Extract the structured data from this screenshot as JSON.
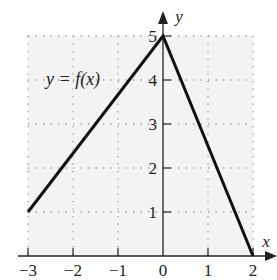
{
  "chart_data": {
    "type": "line",
    "title": "",
    "xlabel": "x",
    "ylabel": "y",
    "annotation": "y = f(x)",
    "xlim": [
      -3,
      2
    ],
    "ylim": [
      0,
      5
    ],
    "xticks": [
      "-3",
      "-2",
      "-1",
      "0",
      "1",
      "2"
    ],
    "yticks": [
      "1",
      "2",
      "3",
      "4",
      "5"
    ],
    "grid": true,
    "grid_style": "dotted",
    "series": [
      {
        "name": "f(x)",
        "x": [
          -3,
          0,
          2
        ],
        "y": [
          1,
          5,
          0
        ]
      }
    ]
  },
  "colors": {
    "line": "#111111",
    "grid": "#9a9a9a",
    "axis": "#222222",
    "plot_bg": "#f3f3f3"
  }
}
